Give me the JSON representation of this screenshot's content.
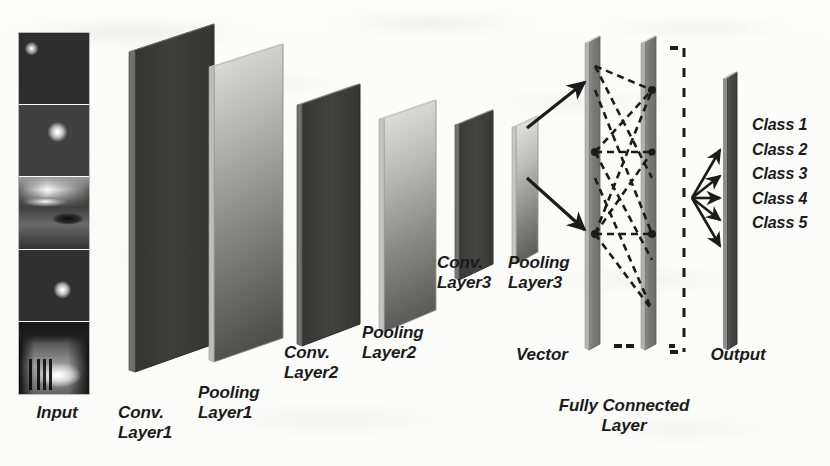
{
  "figure": {
    "background_color": "#fdfdfc",
    "ink_color": "#1b1b1b"
  },
  "stages": {
    "input": {
      "label": "Input",
      "thumbnail_count": 5,
      "description": "vertical stack of five grayscale photographs"
    },
    "conv1": {
      "label": "Conv.\nLayer1",
      "fill": "#3a3a38",
      "kind": "conv"
    },
    "pool1": {
      "label": "Pooling\nLayer1",
      "fill_top": "#d8d8d6",
      "fill_bottom": "#5f5f5d",
      "kind": "pooling"
    },
    "conv2": {
      "label": "Conv.\nLayer2",
      "fill": "#3c3c3a",
      "kind": "conv"
    },
    "pool2": {
      "label": "Pooling\nLayer2",
      "fill_top": "#dcdcda",
      "fill_bottom": "#6a6a68",
      "kind": "pooling"
    },
    "conv3": {
      "label": "Conv.\nLayer3",
      "fill": "#3e3e3c",
      "kind": "conv"
    },
    "pool3": {
      "label": "Pooling\nLayer3",
      "fill_top": "#dedede",
      "fill_bottom": "#6d6d6b",
      "kind": "pooling"
    },
    "vector": {
      "label": "Vector"
    },
    "fully_connected": {
      "label": "Fully Connected\nLayer",
      "bar_count": 2,
      "fill": "#7b7b79"
    },
    "output": {
      "label": "Output",
      "fill": "#4a4a48"
    }
  },
  "classes": [
    {
      "label": "Class 1"
    },
    {
      "label": "Class 2"
    },
    {
      "label": "Class 3"
    },
    {
      "label": "Class 4"
    },
    {
      "label": "Class 5"
    }
  ],
  "connectors": {
    "arrow_up_label": "pooling3-to-fc-upper",
    "arrow_down_label": "pooling3-to-fc-lower",
    "fan_prongs": 5,
    "dashed_boundary": "fully-connected-right-boundary"
  }
}
